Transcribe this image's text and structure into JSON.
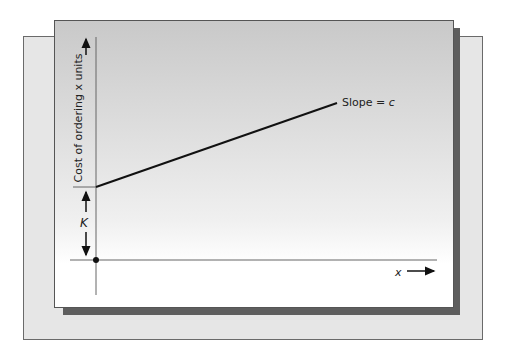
{
  "diagram": {
    "y_axis_label": "Cost of ordering x units",
    "x_axis_label": "x",
    "intercept_label": "K",
    "slope_label_prefix": "Slope = ",
    "slope_label_var": "c",
    "line": {
      "x1": 96,
      "y1": 187,
      "x2": 337,
      "y2": 103
    },
    "colors": {
      "line": "#111111",
      "axis": "#666666",
      "shadow": "#5e5e5e",
      "back_panel": "#e6e6e6"
    }
  }
}
